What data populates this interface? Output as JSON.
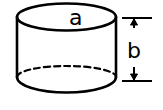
{
  "diagram": {
    "type": "cylinder",
    "labels": {
      "top": "a",
      "height": "b"
    },
    "colors": {
      "stroke": "#000000",
      "background": "#ffffff"
    }
  }
}
